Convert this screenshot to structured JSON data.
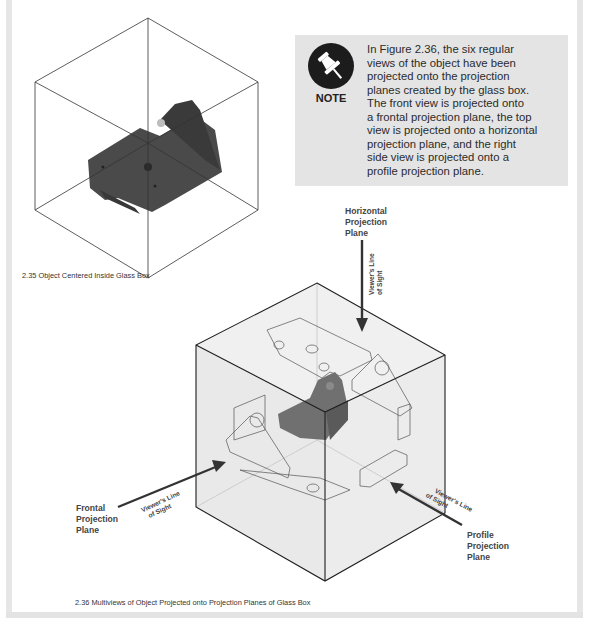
{
  "figure_235": {
    "caption": "2.35  Object Centered Inside Glass Box"
  },
  "note": {
    "icon": "pushpin-icon",
    "label": "NOTE",
    "lines": [
      "In Figure 2.36, the six regular",
      "views of the object have been",
      "projected onto the projection",
      "planes created by the glass box.",
      "The front view is projected onto",
      "a frontal projection plane, the top",
      "view is projected onto a horizontal",
      "projection plane, and the right",
      "side view is projected onto a",
      "profile projection plane."
    ]
  },
  "figure_236": {
    "caption": "2.36  Multiviews of Object Projected onto Projection Planes of Glass Box",
    "labels": {
      "horizontal": [
        "Horizontal",
        "Projection",
        "Plane"
      ],
      "frontal": [
        "Frontal",
        "Projection",
        "Plane"
      ],
      "profile": [
        "Profile",
        "Projection",
        "Plane"
      ]
    },
    "line_of_sight": [
      "Viewer's Line",
      "of Sight"
    ]
  },
  "colors": {
    "note_bg": "#e4e4e4",
    "page_border": "#e6e6e6",
    "object_gray": "#4a4a4a"
  }
}
